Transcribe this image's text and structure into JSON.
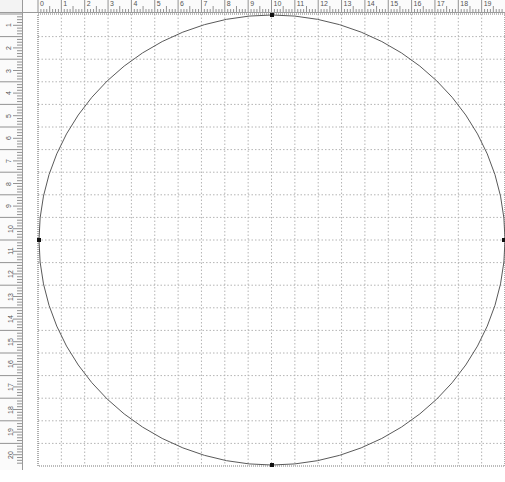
{
  "rulers": {
    "horizontal": {
      "labels": [
        "0",
        "1",
        "2",
        "3",
        "4",
        "5",
        "6",
        "7",
        "8",
        "9",
        "10",
        "11",
        "12",
        "13",
        "14",
        "15",
        "16",
        "17",
        "18",
        "19"
      ],
      "origin_x": 38,
      "unit_px": 23.35
    },
    "vertical": {
      "labels": [
        "1",
        "2",
        "3",
        "4",
        "5",
        "6",
        "7",
        "8",
        "9",
        "10",
        "11",
        "12",
        "13",
        "14",
        "15",
        "16",
        "17",
        "18",
        "19",
        "20"
      ],
      "origin_y": 14,
      "unit_px": 22.6
    }
  },
  "page": {
    "left": 38,
    "top": 14,
    "right": 505,
    "bottom": 466,
    "border_color": "#7a7a7a",
    "grid_color": "#b4b4b4",
    "grid_columns": 20,
    "grid_rows": 20
  },
  "shape": {
    "type": "circle",
    "cx": 272,
    "cy": 240,
    "rx": 233,
    "ry": 225,
    "stroke": "#5a5a5a",
    "anchors": [
      {
        "name": "top",
        "x": 272,
        "y": 15
      },
      {
        "name": "bottom",
        "x": 272,
        "y": 465
      },
      {
        "name": "left",
        "x": 39,
        "y": 240
      },
      {
        "name": "right",
        "x": 504,
        "y": 240
      }
    ],
    "anchor_color": "#111111"
  },
  "status_bar": {
    "left_text": "",
    "right_text": ""
  }
}
